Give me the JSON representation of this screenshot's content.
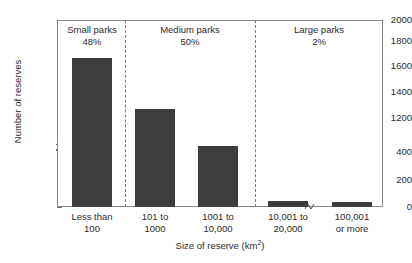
{
  "chart_data": {
    "type": "bar",
    "title": "",
    "subtitle": "",
    "xlabel": "Size of reserve (km2)",
    "xlabel_base": "Size of reserve (km",
    "xlabel_sup": "2",
    "xlabel_tail": ")",
    "ylabel": "Number of reserves",
    "categories": [
      "Less than 100",
      "101 to 1000",
      "1001 to 10,000",
      "10,001 to 20,000",
      "100,001 or more"
    ],
    "category_lines": [
      {
        "line1": "Less than",
        "line2": "100"
      },
      {
        "line1": "101 to",
        "line2": "1000"
      },
      {
        "line1": "1001 to",
        "line2": "10,000"
      },
      {
        "line1": "10,001 to",
        "line2": "20,000"
      },
      {
        "line1": "100,001",
        "line2": "or more"
      }
    ],
    "values": [
      1690,
      1270,
      540,
      45,
      40
    ],
    "ylim": [
      0,
      2000
    ],
    "ytick_labels": [
      "0",
      "200",
      "400",
      "1200",
      "1400",
      "1600",
      "1800",
      "2000"
    ],
    "ytick_values": [
      0,
      200,
      400,
      1200,
      1400,
      1600,
      1800,
      2000
    ],
    "y_axis_break": {
      "present": true,
      "between": [
        400,
        1200
      ]
    },
    "x_axis_break": {
      "present": true,
      "between": [
        "10,001 to 20,000",
        "100,001 or more"
      ]
    },
    "grid": false,
    "legend": "none",
    "bar_color": "#3d3d3d",
    "frame_color": "#8a8a8a",
    "groups": [
      {
        "name": "Small parks",
        "percent": "48%",
        "categories": [
          "Less than 100"
        ]
      },
      {
        "name": "Medium parks",
        "percent": "50%",
        "categories": [
          "101 to 1000",
          "1001 to 10,000"
        ]
      },
      {
        "name": "Large parks",
        "percent": "2%",
        "categories": [
          "10,001 to 20,000",
          "100,001 or more"
        ]
      }
    ]
  }
}
